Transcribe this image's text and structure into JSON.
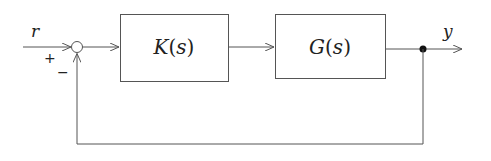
{
  "diagram": {
    "type": "feedback-control-block-diagram",
    "colors": {
      "line": "#555555",
      "text": "#222222",
      "node": "#111111",
      "background": "#ffffff"
    },
    "signals": {
      "input": "r",
      "output": "y"
    },
    "summing_junction": {
      "plus_sign": "+",
      "minus_sign": "−"
    },
    "blocks": [
      {
        "id": "controller",
        "symbol": "K",
        "arg": "(s)",
        "label": "K(s)"
      },
      {
        "id": "plant",
        "symbol": "G",
        "arg": "(s)",
        "label": "G(s)"
      }
    ],
    "feedback": "negative unity feedback from y to summing junction"
  }
}
